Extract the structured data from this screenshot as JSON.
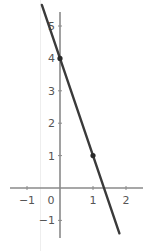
{
  "chart_data": {
    "type": "line",
    "title": "",
    "xlabel": "",
    "ylabel": "",
    "xlim": [
      -1.5,
      2.3
    ],
    "ylim": [
      -1.5,
      6.6
    ],
    "grid": false,
    "x_ticks": [
      -1,
      0,
      1,
      2
    ],
    "y_ticks": [
      -1,
      1,
      2,
      3,
      4,
      5
    ],
    "x_tick_labels": [
      "−1",
      "0",
      "1",
      "2"
    ],
    "y_tick_labels": [
      "−1",
      "1",
      "2",
      "3",
      "4",
      "5"
    ],
    "series": [
      {
        "name": "y = -3x + 4",
        "equation": "y = -3x + 4",
        "slope": -3,
        "intercept": 4,
        "x": [
          -0.55,
          1.8
        ],
        "y": [
          5.65,
          -1.4
        ],
        "color": "#3a3a3a"
      }
    ],
    "points": [
      {
        "x": 0,
        "y": 4,
        "label": "(0, 4)"
      },
      {
        "x": 1,
        "y": 1,
        "label": "(1, 1)"
      }
    ]
  },
  "colors": {
    "axis": "#8a8a8a",
    "line": "#3a3a3a",
    "point": "#2a2a2a",
    "panel_border": "#eeeeee",
    "tick_text": "#555555"
  }
}
